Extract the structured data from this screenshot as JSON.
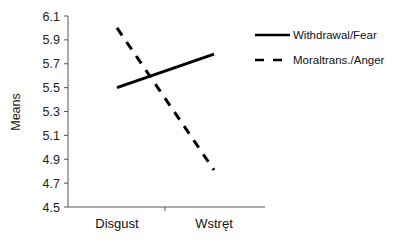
{
  "chart_data": {
    "type": "line",
    "title": "",
    "xlabel": "",
    "ylabel": "Means",
    "categories": [
      "Disgust",
      "Wstręt"
    ],
    "series": [
      {
        "name": "Withdrawal/Fear",
        "style": "solid",
        "color": "#000000",
        "values": [
          5.5,
          5.78
        ]
      },
      {
        "name": "Moral trans./Anger",
        "style": "dashed",
        "color": "#000000",
        "values": [
          6.0,
          4.81
        ]
      }
    ],
    "ylim": [
      4.5,
      6.1
    ],
    "yticks": [
      "6.1",
      "5.9",
      "5.7",
      "5.5",
      "5.3",
      "5.1",
      "4.9",
      "4.7",
      "4.5"
    ],
    "grid": false,
    "legend_position": "top-right"
  },
  "legend": {
    "items": [
      {
        "label": "Withdrawal/Fear"
      },
      {
        "label": "Moraltrans./Anger"
      }
    ]
  },
  "axis": {
    "ylabel": "Means"
  }
}
